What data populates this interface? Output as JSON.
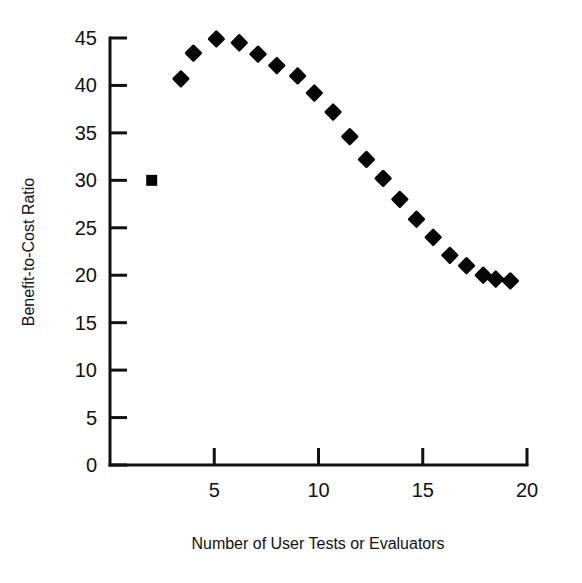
{
  "chart_data": {
    "type": "scatter",
    "title": "",
    "xlabel": "Number of User Tests or Evaluators",
    "ylabel": "Benefit-to-Cost Ratio",
    "xlim": [
      0,
      20
    ],
    "ylim": [
      0,
      45
    ],
    "xticks": [
      0,
      5,
      10,
      15,
      20
    ],
    "xtick_labels": [
      "",
      "5",
      "10",
      "15",
      "20"
    ],
    "yticks": [
      0,
      5,
      10,
      15,
      20,
      25,
      30,
      35,
      40,
      45
    ],
    "ytick_labels": [
      "0",
      "5",
      "10",
      "15",
      "20",
      "25",
      "30",
      "35",
      "40",
      "45"
    ],
    "grid": false,
    "legend": false,
    "marker": "filled-diamond",
    "marker_color": "#050505",
    "x": [
      2.0,
      3.4,
      4.0,
      5.1,
      6.2,
      7.1,
      8.0,
      9.0,
      9.8,
      10.7,
      11.5,
      12.3,
      13.1,
      13.9,
      14.7,
      15.5,
      16.3,
      17.1,
      17.9,
      18.5,
      19.2
    ],
    "values": [
      30.0,
      40.7,
      43.4,
      44.9,
      44.5,
      43.3,
      42.1,
      41.0,
      39.2,
      37.2,
      34.6,
      32.2,
      30.2,
      28.0,
      25.9,
      24.0,
      22.1,
      21.0,
      20.0,
      19.6,
      19.4
    ],
    "points": [
      {
        "x": 2.0,
        "y": 30.0
      },
      {
        "x": 3.4,
        "y": 40.7
      },
      {
        "x": 4.0,
        "y": 43.4
      },
      {
        "x": 5.1,
        "y": 44.9
      },
      {
        "x": 6.2,
        "y": 44.5
      },
      {
        "x": 7.1,
        "y": 43.3
      },
      {
        "x": 8.0,
        "y": 42.1
      },
      {
        "x": 9.0,
        "y": 41.0
      },
      {
        "x": 9.8,
        "y": 39.2
      },
      {
        "x": 10.7,
        "y": 37.2
      },
      {
        "x": 11.5,
        "y": 34.6
      },
      {
        "x": 12.3,
        "y": 32.2
      },
      {
        "x": 13.1,
        "y": 30.2
      },
      {
        "x": 13.9,
        "y": 28.0
      },
      {
        "x": 14.7,
        "y": 25.9
      },
      {
        "x": 15.5,
        "y": 24.0
      },
      {
        "x": 16.3,
        "y": 22.1
      },
      {
        "x": 17.1,
        "y": 21.0
      },
      {
        "x": 17.9,
        "y": 20.0
      },
      {
        "x": 18.5,
        "y": 19.6
      },
      {
        "x": 19.2,
        "y": 19.4
      }
    ]
  },
  "figure": {
    "background_color": "#ffffff",
    "axis_color": "#111111"
  }
}
